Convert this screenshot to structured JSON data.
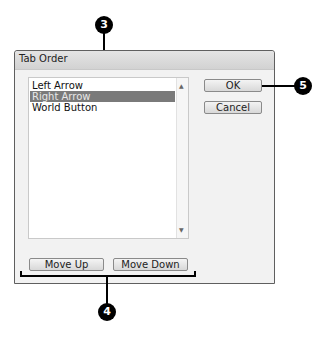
{
  "dialog": {
    "title": "Tab Order",
    "list": {
      "items": [
        {
          "label": "Left Arrow",
          "selected": false
        },
        {
          "label": "Right Arrow",
          "selected": true
        },
        {
          "label": "World Button",
          "selected": false
        }
      ]
    },
    "buttons": {
      "ok": "OK",
      "cancel": "Cancel",
      "move_up": "Move Up",
      "move_down": "Move Down"
    },
    "scroll_icons": {
      "up": "▲",
      "down": "▼"
    }
  },
  "callouts": [
    {
      "number": "3",
      "target": "Right Arrow list item"
    },
    {
      "number": "5",
      "target": "OK button"
    },
    {
      "number": "4",
      "target": "Move Up / Move Down buttons"
    }
  ]
}
